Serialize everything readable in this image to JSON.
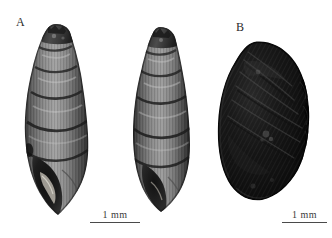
{
  "figure": {
    "background_color": "#ffffff",
    "type": "scientific-specimen-plate"
  },
  "panels": [
    {
      "id": "A",
      "label": "A",
      "specimen_count": 2,
      "scalebar": {
        "label": "1 mm",
        "length_px": 50
      }
    },
    {
      "id": "B",
      "label": "B",
      "specimen_count": 1,
      "scalebar": {
        "label": "1 mm",
        "length_px": 45
      }
    }
  ],
  "labels": {
    "panel_a": "A",
    "panel_b": "B"
  },
  "scalebars": {
    "a": "1 mm",
    "b": "1 mm"
  },
  "colors": {
    "background": "#ffffff",
    "label_text": "#2b2b2b",
    "scalebar_line": "#4a4a4a",
    "shell_mid": "#7a7a7a",
    "shell_dark": "#3a3a3a",
    "shell_light": "#b9b9b9",
    "shell_b_dark": "#141414"
  }
}
